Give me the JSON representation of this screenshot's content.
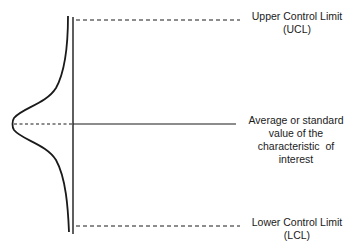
{
  "diagram": {
    "type": "control-chart-schematic",
    "lines": {
      "ucl": {
        "style": "dashed",
        "y": 20
      },
      "center": {
        "style": "solid",
        "y": 124
      },
      "lcl": {
        "style": "dashed",
        "y": 226
      }
    },
    "distribution_curve": {
      "shape": "normal",
      "orientation": "vertical-left"
    },
    "colors": {
      "ink": "#1a1a1a",
      "background": "#ffffff"
    }
  },
  "labels": {
    "ucl": {
      "line1": "Upper Control Limit",
      "line2": "(UCL)"
    },
    "center": {
      "line1": "Average or standard",
      "line2": "value of the",
      "line3": "characteristic  of",
      "line4": "interest"
    },
    "lcl": {
      "line1": "Lower Control Limit",
      "line2": "(LCL)"
    }
  }
}
